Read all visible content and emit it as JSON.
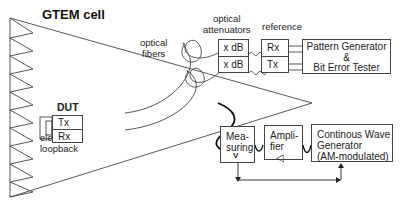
{
  "diagram": {
    "title": "GTEM cell",
    "labels": {
      "optical_fibers": [
        "optical",
        "fibers"
      ],
      "optical_attenuators": [
        "optical",
        "attenuators"
      ],
      "reference": "reference",
      "dut": "DUT",
      "electrical_loopback": [
        "electrical",
        "loopback"
      ]
    },
    "dut_ports": {
      "tx": "Tx",
      "rx": "Rx"
    },
    "attenuators": [
      "x dB",
      "x dB"
    ],
    "reference_ports": {
      "rx": "Rx",
      "tx": "Tx"
    },
    "pattern_generator": [
      "Pattern Generator",
      "&",
      "Bit Error Tester"
    ],
    "measuring": {
      "lines": [
        "Mea-",
        "suring"
      ],
      "symbol": "V"
    },
    "amplifier": {
      "lines": [
        "Ampli-",
        "fier"
      ],
      "symbol": "◁"
    },
    "cw_generator": [
      "Continous Wave",
      "Generator",
      "(AM-modulated)"
    ],
    "colors": {
      "line": "#333333",
      "cable": "#111111",
      "background": "#ffffff"
    }
  }
}
